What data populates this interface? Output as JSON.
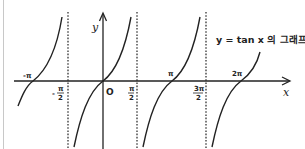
{
  "figure": {
    "caption": "y = tan x 의 그래프",
    "x_axis_label": "x",
    "y_axis_label": "y",
    "origin_label": "O",
    "tick_labels": {
      "neg_pi": "-π",
      "neg_pi_over_2_num": "π",
      "neg_pi_over_2_den": "2",
      "neg_pi_over_2_sign": "-",
      "pi_over_2_num": "π",
      "pi_over_2_den": "2",
      "pi": "π",
      "three_pi_over_2_num": "3π",
      "three_pi_over_2_den": "2",
      "two_pi": "2π"
    },
    "asymptotes": [
      "x = -π/2",
      "x = π/2",
      "x = 3π/2"
    ],
    "zeros": [
      "-π",
      "0",
      "π",
      "2π"
    ],
    "colors": {
      "curve": "#222222",
      "axis": "#222222",
      "asymptote": "#333333",
      "border": "#c8c8c8"
    }
  }
}
